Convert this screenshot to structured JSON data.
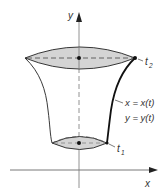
{
  "diagram": {
    "axes": {
      "x_label": "x",
      "y_label": "y"
    },
    "parameter_labels": {
      "top": "t",
      "top_sub": "2",
      "bottom": "t",
      "bottom_sub": "1"
    },
    "curve_labels": {
      "x_eq": "x = x(t)",
      "y_eq": "y = y(t)"
    },
    "colors": {
      "fill": "#d4d4d4",
      "stroke": "#222222",
      "axis": "#555555",
      "background": "#ffffff"
    }
  }
}
